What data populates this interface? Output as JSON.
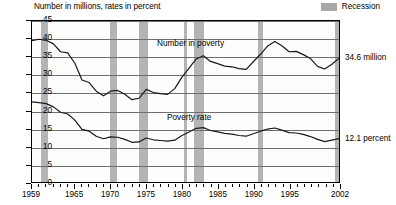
{
  "chart_data": {
    "type": "line",
    "title": "",
    "ylabel": "Number in millions, rates in percent",
    "xlabel": "",
    "ylim": [
      0,
      45
    ],
    "ytick_values": [
      0,
      5,
      10,
      15,
      20,
      25,
      30,
      35,
      40,
      45
    ],
    "xlim": [
      1959,
      2002
    ],
    "xtick_labels": [
      "1959",
      "1965",
      "1970",
      "1975",
      "1980",
      "1985",
      "1990",
      "1995",
      "2002"
    ],
    "xtick_values": [
      1959,
      1965,
      1970,
      1975,
      1980,
      1985,
      1990,
      1995,
      2002
    ],
    "grid": true,
    "legend_position": "top-right",
    "legend": [
      {
        "label": "Recession",
        "color": "#b4b4b4",
        "type": "band"
      }
    ],
    "annotations": [
      {
        "text": "Number in poverty",
        "x": 1981,
        "y": 38.5
      },
      {
        "text": "Poverty rate",
        "x": 1981,
        "y": 18.0
      },
      {
        "text": "34.6 million",
        "x": 2002,
        "y": 34.6,
        "position": "right"
      },
      {
        "text": "12.1 percent",
        "x": 2002,
        "y": 12.1,
        "position": "right"
      }
    ],
    "recession_bands": [
      {
        "start": 1960.3,
        "end": 1961.2
      },
      {
        "start": 1969.9,
        "end": 1970.9
      },
      {
        "start": 1973.9,
        "end": 1975.2
      },
      {
        "start": 1980.1,
        "end": 1980.6
      },
      {
        "start": 1981.5,
        "end": 1982.9
      },
      {
        "start": 1990.5,
        "end": 1991.2
      },
      {
        "start": 2001.2,
        "end": 2001.9
      }
    ],
    "x": [
      1959,
      1960,
      1961,
      1962,
      1963,
      1964,
      1965,
      1966,
      1967,
      1968,
      1969,
      1970,
      1971,
      1972,
      1973,
      1974,
      1975,
      1976,
      1977,
      1978,
      1979,
      1980,
      1981,
      1982,
      1983,
      1984,
      1985,
      1986,
      1987,
      1988,
      1989,
      1990,
      1991,
      1992,
      1993,
      1994,
      1995,
      1996,
      1997,
      1998,
      1999,
      2000,
      2001,
      2002
    ],
    "series": [
      {
        "name": "Number in poverty",
        "unit": "millions",
        "color": "#1a1a1a",
        "values": [
          39.5,
          39.9,
          39.6,
          38.6,
          36.4,
          36.1,
          33.2,
          28.5,
          27.8,
          25.4,
          24.1,
          25.4,
          25.6,
          24.5,
          23.0,
          23.4,
          25.9,
          25.0,
          24.7,
          24.5,
          26.1,
          29.3,
          31.8,
          34.4,
          35.3,
          33.7,
          33.1,
          32.4,
          32.2,
          31.7,
          31.5,
          33.6,
          35.7,
          38.0,
          39.3,
          38.1,
          36.4,
          36.5,
          35.6,
          34.5,
          32.3,
          31.6,
          32.9,
          34.6
        ]
      },
      {
        "name": "Poverty rate",
        "unit": "percent",
        "color": "#1a1a1a",
        "values": [
          22.4,
          22.2,
          21.9,
          21.0,
          19.5,
          19.0,
          17.3,
          14.7,
          14.2,
          12.8,
          12.1,
          12.6,
          12.5,
          11.9,
          11.1,
          11.2,
          12.3,
          11.8,
          11.6,
          11.4,
          11.7,
          13.0,
          14.0,
          15.0,
          15.2,
          14.4,
          14.0,
          13.6,
          13.4,
          13.0,
          12.8,
          13.5,
          14.2,
          14.8,
          15.1,
          14.5,
          13.8,
          13.7,
          13.3,
          12.7,
          11.9,
          11.3,
          11.7,
          12.1
        ]
      }
    ]
  },
  "chart": {
    "axis_title": "Number in millions, rates in percent",
    "legend_label": "Recession",
    "label_number": "Number in poverty",
    "label_rate": "Poverty rate",
    "end_label_number": "34.6 million",
    "end_label_rate": "12.1 percent",
    "colors": {
      "recession": "#b4b4b4",
      "line": "#1a1a1a",
      "grid": "#6e6e6e",
      "axis": "#000000"
    }
  }
}
